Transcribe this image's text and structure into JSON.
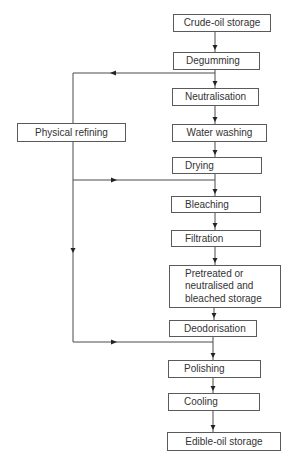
{
  "diagram": {
    "type": "flowchart",
    "nodes": [
      {
        "id": "crude",
        "label": "Crude-oil storage",
        "x": 173,
        "y": 14,
        "w": 98,
        "h": 18,
        "align": "center"
      },
      {
        "id": "degumming",
        "label": "Degumming",
        "x": 173,
        "y": 52,
        "w": 87,
        "h": 18,
        "align": "left"
      },
      {
        "id": "neutralisation",
        "label": "Neutralisation",
        "x": 172,
        "y": 88,
        "w": 87,
        "h": 18,
        "align": "center"
      },
      {
        "id": "water_washing",
        "label": "Water washing",
        "x": 172,
        "y": 124,
        "w": 95,
        "h": 18,
        "align": "center"
      },
      {
        "id": "drying",
        "label": "Drying",
        "x": 172,
        "y": 157,
        "w": 90,
        "h": 17,
        "align": "left"
      },
      {
        "id": "bleaching",
        "label": "Bleaching",
        "x": 171,
        "y": 196,
        "w": 90,
        "h": 17,
        "align": "left"
      },
      {
        "id": "filtration",
        "label": "Filtration",
        "x": 171,
        "y": 230,
        "w": 90,
        "h": 17,
        "align": "left"
      },
      {
        "id": "pretreated",
        "label": "Pretreated or neutralised and bleached storage",
        "x": 169,
        "y": 265,
        "w": 112,
        "h": 43,
        "align": "multi"
      },
      {
        "id": "deodorisation",
        "label": "Deodorisation",
        "x": 169,
        "y": 320,
        "w": 88,
        "h": 17,
        "align": "left"
      },
      {
        "id": "polishing",
        "label": "Polishing",
        "x": 168,
        "y": 360,
        "w": 93,
        "h": 18,
        "align": "left"
      },
      {
        "id": "cooling",
        "label": "Cooling",
        "x": 168,
        "y": 393,
        "w": 92,
        "h": 18,
        "align": "left"
      },
      {
        "id": "edible",
        "label": "Edible-oil storage",
        "x": 167,
        "y": 432,
        "w": 114,
        "h": 19,
        "align": "center"
      },
      {
        "id": "physical",
        "label": "Physical refining",
        "x": 17,
        "y": 123,
        "w": 109,
        "h": 19,
        "align": "center"
      }
    ],
    "edges": [
      {
        "from": "crude",
        "to": "degumming"
      },
      {
        "from": "degumming",
        "to": "neutralisation"
      },
      {
        "from": "neutralisation",
        "to": "water_washing"
      },
      {
        "from": "water_washing",
        "to": "drying"
      },
      {
        "from": "drying",
        "to": "bleaching"
      },
      {
        "from": "bleaching",
        "to": "filtration"
      },
      {
        "from": "filtration",
        "to": "pretreated"
      },
      {
        "from": "pretreated",
        "to": "deodorisation"
      },
      {
        "from": "deodorisation",
        "to": "polishing"
      },
      {
        "from": "polishing",
        "to": "cooling"
      },
      {
        "from": "cooling",
        "to": "edible"
      },
      {
        "from": "degumming",
        "to": "physical",
        "note": "branch left at y=73"
      },
      {
        "from": "physical",
        "to": "bleaching",
        "note": "rejoin main line after drying at y=180"
      },
      {
        "from": "physical",
        "to": "polishing",
        "note": "rejoin main line after deodorisation at y=342"
      }
    ]
  },
  "style": {
    "line_color": "#4a4a4a",
    "border_color": "#5a5a5a",
    "text_color": "#333333",
    "background": "#ffffff"
  }
}
